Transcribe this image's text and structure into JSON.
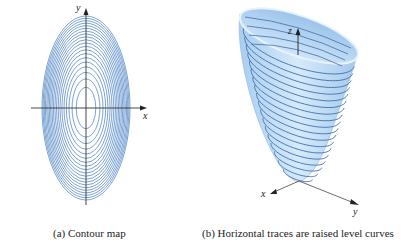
{
  "figure": {
    "panel_a": {
      "caption": "(a) Contour map",
      "x_label": "x",
      "y_label": "y",
      "center": [
        86,
        108
      ],
      "outer_rx": 44,
      "outer_ry": 92,
      "contour_count": 20,
      "line_color": "#5a8cc8"
    },
    "panel_b": {
      "caption": "(b) Horizontal traces are raised level curves",
      "x_label": "x",
      "y_label": "y",
      "z_label": "z",
      "surface_color": "#c4def4",
      "trace_color": "#3f6fb0",
      "trace_count": 18
    }
  }
}
